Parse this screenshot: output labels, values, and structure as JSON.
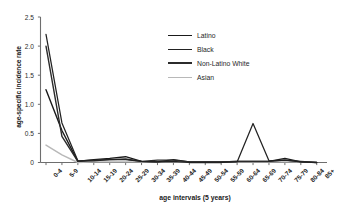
{
  "chart_data": {
    "type": "line",
    "title": "",
    "subtitle": "",
    "xlabel": "age intervals (5 years)",
    "ylabel": "age-specific incidence rate",
    "categories": [
      "0-4",
      "5-9",
      "10-14",
      "15-19",
      "20-24",
      "25-29",
      "30-34",
      "35-39",
      "40-44",
      "45-49",
      "50-54",
      "55-59",
      "60-64",
      "65-69",
      "70-74",
      "75-79",
      "80-84",
      "85+"
    ],
    "ylim": [
      0,
      2.5
    ],
    "yticks": [
      "0",
      "0.5",
      "1.0",
      "1.5",
      "2.0",
      "2.5"
    ],
    "ytick_values": [
      0,
      0.5,
      1.0,
      1.5,
      2.0,
      2.5
    ],
    "grid": false,
    "legend_position": "upper-center-right",
    "series": [
      {
        "name": "Latino",
        "color": "#1a1a1a",
        "values": [
          1.25,
          0.55,
          0.02,
          0.05,
          0.07,
          0.1,
          0.02,
          0.01,
          0.05,
          0.01,
          0.01,
          0.01,
          0.02,
          0.02,
          0.02,
          0.07,
          0.01,
          0.0
        ]
      },
      {
        "name": "Black",
        "color": "#222222",
        "values": [
          2.2,
          0.68,
          0.03,
          0.04,
          0.05,
          0.05,
          0.02,
          0.01,
          0.02,
          0.0,
          0.0,
          0.0,
          0.01,
          0.67,
          0.03,
          0.04,
          0.01,
          0.0
        ]
      },
      {
        "name": "Non-Latino White",
        "color": "#2b2b2b",
        "values": [
          2.0,
          0.45,
          0.02,
          0.03,
          0.05,
          0.06,
          0.02,
          0.04,
          0.04,
          0.01,
          0.01,
          0.01,
          0.02,
          0.02,
          0.02,
          0.04,
          0.02,
          0.0
        ]
      },
      {
        "name": "Asian",
        "color": "#b8b8b8",
        "values": [
          0.3,
          0.13,
          0.0,
          0.01,
          0.01,
          0.01,
          0.01,
          0.01,
          0.01,
          0.01,
          0.01,
          0.01,
          0.01,
          0.01,
          0.01,
          0.01,
          0.01,
          0.0
        ]
      }
    ]
  },
  "axes": {
    "ylabel": "age-specific incidence rate",
    "xlabel": "age intervals (5 years)"
  },
  "legend": {
    "items": [
      {
        "label": "Latino",
        "color": "#1a1a1a",
        "width": "1.9px"
      },
      {
        "label": "Black",
        "color": "#222222",
        "width": "1.6px"
      },
      {
        "label": "Non-Latino White",
        "color": "#2b2b2b",
        "width": "2.1px"
      },
      {
        "label": "Asian",
        "color": "#b8b8b8",
        "width": "1.5px"
      }
    ]
  },
  "colors": {
    "axis": "#6e6e6e",
    "text": "#1f1f1f",
    "background": "#ffffff"
  }
}
